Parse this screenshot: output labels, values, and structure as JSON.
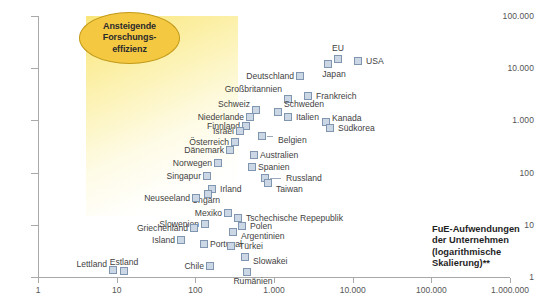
{
  "chart_data": {
    "type": "scatter",
    "title": "",
    "xlabel": "FuE-Aufwendungen der Unternehmen (logarithmische Skalierung)**",
    "ylabel": "",
    "xscale": "log",
    "yscale": "log",
    "xlim": [
      1,
      1000000
    ],
    "ylim": [
      1,
      100000
    ],
    "grid": false,
    "legend": null,
    "x_ticks": [
      "1",
      "10",
      "100",
      "1.000",
      "10.000",
      "100.000",
      "1.000.000"
    ],
    "x_tick_values": [
      1,
      10,
      100,
      1000,
      10000,
      100000,
      1000000
    ],
    "y_ticks": [
      "1",
      "10",
      "100",
      "1.000",
      "10.000",
      "100.000"
    ],
    "y_tick_values": [
      1,
      10,
      100,
      1000,
      10000,
      100000
    ],
    "annotations": [
      {
        "name": "efficiency-callout",
        "lines": [
          "Ansteigende",
          "Forschungs-",
          "effizienz"
        ],
        "shape": "ellipse",
        "fill": "#f5c842",
        "stroke": "#c29a18"
      }
    ],
    "marker_style": {
      "shape": "square",
      "fill": "#ccd7e6",
      "stroke": "#7f95b0"
    },
    "points": [
      {
        "label": "USA",
        "x": 300000,
        "y": 22000,
        "px": 358,
        "py": 61,
        "lx": 366,
        "ly": 61,
        "side": "l"
      },
      {
        "label": "EU",
        "x": 150000,
        "y": 24000,
        "px": 338,
        "py": 59,
        "lx": 338,
        "ly": 48,
        "side": "c"
      },
      {
        "label": "Japan",
        "x": 110000,
        "y": 16000,
        "px": 328,
        "py": 64,
        "lx": 334,
        "ly": 74,
        "side": "c"
      },
      {
        "label": "Deutschland",
        "x": 38000,
        "y": 9000,
        "px": 300,
        "py": 76,
        "lx": 294,
        "ly": 76,
        "side": "r"
      },
      {
        "label": "Frankreich",
        "x": 26000,
        "y": 5000,
        "px": 308,
        "py": 96,
        "lx": 316,
        "ly": 96,
        "side": "l"
      },
      {
        "label": "Großbritannien",
        "x": 20000,
        "y": 4200,
        "px": 288,
        "py": 99,
        "lx": 282,
        "ly": 89,
        "side": "r"
      },
      {
        "label": "Schweden",
        "x": 9000,
        "y": 2200,
        "px": 278,
        "py": 112,
        "lx": 284,
        "ly": 104,
        "side": "l"
      },
      {
        "label": "Italien",
        "x": 9000,
        "y": 1700,
        "px": 288,
        "py": 117,
        "lx": 296,
        "ly": 117,
        "side": "l"
      },
      {
        "label": "Schweiz",
        "x": 5200,
        "y": 2100,
        "px": 256,
        "py": 110,
        "lx": 250,
        "ly": 104,
        "side": "r"
      },
      {
        "label": "Niederlande",
        "x": 4200,
        "y": 1500,
        "px": 250,
        "py": 117,
        "lx": 244,
        "ly": 117,
        "side": "r"
      },
      {
        "label": "Kanada",
        "x": 13000,
        "y": 1500,
        "px": 326,
        "py": 122,
        "lx": 332,
        "ly": 118,
        "side": "l"
      },
      {
        "label": "Südkorea",
        "x": 14000,
        "y": 1200,
        "px": 330,
        "py": 128,
        "lx": 338,
        "ly": 128,
        "side": "l"
      },
      {
        "label": "Finnland",
        "x": 3500,
        "y": 1200,
        "px": 246,
        "py": 126,
        "lx": 240,
        "ly": 126,
        "side": "r"
      },
      {
        "label": "Israel",
        "x": 2600,
        "y": 900,
        "px": 240,
        "py": 131,
        "lx": 234,
        "ly": 131,
        "side": "r"
      },
      {
        "label": "Belgien",
        "x": 5000,
        "y": 800,
        "px": 262,
        "py": 136,
        "lx": 278,
        "ly": 140,
        "side": "l"
      },
      {
        "label": "Österreich",
        "x": 2100,
        "y": 640,
        "px": 235,
        "py": 142,
        "lx": 229,
        "ly": 142,
        "side": "r"
      },
      {
        "label": "Dänemark",
        "x": 1900,
        "y": 520,
        "px": 230,
        "py": 150,
        "lx": 224,
        "ly": 150,
        "side": "r"
      },
      {
        "label": "Australien",
        "x": 3400,
        "y": 450,
        "px": 254,
        "py": 155,
        "lx": 260,
        "ly": 155,
        "side": "l"
      },
      {
        "label": "Norwegen",
        "x": 1300,
        "y": 330,
        "px": 218,
        "py": 163,
        "lx": 212,
        "ly": 163,
        "side": "r"
      },
      {
        "label": "Spanien",
        "x": 3200,
        "y": 300,
        "px": 252,
        "py": 167,
        "lx": 258,
        "ly": 167,
        "side": "l"
      },
      {
        "label": "Russland",
        "x": 4800,
        "y": 210,
        "px": 265,
        "py": 178,
        "lx": 286,
        "ly": 178,
        "side": "l"
      },
      {
        "label": "Singapur",
        "x": 900,
        "y": 190,
        "px": 207,
        "py": 176,
        "lx": 201,
        "ly": 176,
        "side": "r"
      },
      {
        "label": "Taiwan",
        "x": 4600,
        "y": 170,
        "px": 268,
        "py": 183,
        "lx": 276,
        "ly": 189,
        "side": "l"
      },
      {
        "label": "Irland",
        "x": 1000,
        "y": 120,
        "px": 212,
        "py": 189,
        "lx": 220,
        "ly": 189,
        "side": "l"
      },
      {
        "label": "Ungarn",
        "x": 950,
        "y": 100,
        "px": 208,
        "py": 194,
        "lx": 206,
        "ly": 200,
        "side": "c"
      },
      {
        "label": "Neuseeland",
        "x": 600,
        "y": 78,
        "px": 196,
        "py": 198,
        "lx": 190,
        "ly": 198,
        "side": "r"
      },
      {
        "label": "Mexiko",
        "x": 1600,
        "y": 40,
        "px": 228,
        "py": 213,
        "lx": 222,
        "ly": 213,
        "side": "r"
      },
      {
        "label": "Tschechische Repepublik",
        "x": 2000,
        "y": 34,
        "px": 238,
        "py": 218,
        "lx": 246,
        "ly": 218,
        "side": "l"
      },
      {
        "label": "Slowenien",
        "x": 700,
        "y": 28,
        "px": 205,
        "py": 224,
        "lx": 199,
        "ly": 224,
        "side": "r"
      },
      {
        "label": "Polen",
        "x": 2100,
        "y": 28,
        "px": 242,
        "py": 226,
        "lx": 250,
        "ly": 226,
        "side": "l"
      },
      {
        "label": "Griechenland",
        "x": 560,
        "y": 26,
        "px": 194,
        "py": 228,
        "lx": 188,
        "ly": 228,
        "side": "r"
      },
      {
        "label": "Argentinien",
        "x": 1800,
        "y": 22,
        "px": 233,
        "py": 232,
        "lx": 241,
        "ly": 236,
        "side": "l"
      },
      {
        "label": "Island",
        "x": 330,
        "y": 17,
        "px": 181,
        "py": 240,
        "lx": 175,
        "ly": 240,
        "side": "r"
      },
      {
        "label": "Portugal",
        "x": 700,
        "y": 15,
        "px": 204,
        "py": 244,
        "lx": 210,
        "ly": 244,
        "side": "l"
      },
      {
        "label": "Türkei",
        "x": 1700,
        "y": 14,
        "px": 231,
        "py": 246,
        "lx": 239,
        "ly": 246,
        "side": "l"
      },
      {
        "label": "Slowakei",
        "x": 2100,
        "y": 7,
        "px": 245,
        "py": 257,
        "lx": 253,
        "ly": 261,
        "side": "l"
      },
      {
        "label": "Chile",
        "x": 900,
        "y": 4,
        "px": 210,
        "py": 266,
        "lx": 204,
        "ly": 266,
        "side": "r"
      },
      {
        "label": "Rumänien",
        "x": 2200,
        "y": 1.2,
        "px": 247,
        "py": 272,
        "lx": 253,
        "ly": 281,
        "side": "c"
      },
      {
        "label": "Estland",
        "x": 22,
        "y": 1.1,
        "px": 124,
        "py": 271,
        "lx": 124,
        "ly": 262,
        "side": "c"
      },
      {
        "label": "Lettland",
        "x": 13,
        "y": 1.1,
        "px": 113,
        "py": 270,
        "lx": 107,
        "ly": 264,
        "side": "r"
      }
    ]
  },
  "axis_caption": {
    "line1": "FuE-Aufwendungen",
    "line2": "der Unternehmen",
    "line3": "(logarithmische",
    "line4": "Skalierung)**"
  }
}
